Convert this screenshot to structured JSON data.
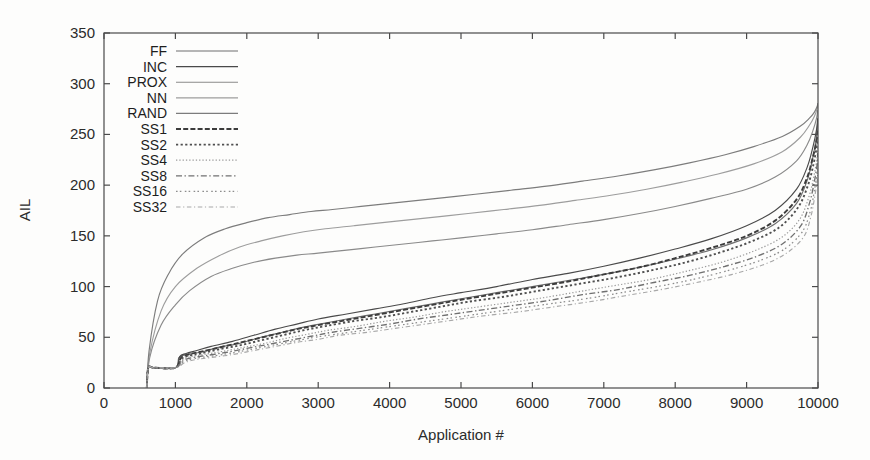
{
  "chart_data": {
    "type": "line",
    "title": "",
    "xlabel": "Application #",
    "ylabel": "AIL",
    "xlim": [
      0,
      10000
    ],
    "ylim": [
      0,
      350
    ],
    "xticks": [
      0,
      1000,
      2000,
      3000,
      4000,
      5000,
      6000,
      7000,
      8000,
      9000,
      10000
    ],
    "yticks": [
      0,
      50,
      100,
      150,
      200,
      250,
      300,
      350
    ],
    "grid": false,
    "legend_position": "top-left-inside",
    "series": [
      {
        "name": "FF",
        "style": "solid",
        "color": "#6f6f6f",
        "x": [
          600,
          620,
          700,
          1000,
          1050,
          1150,
          1250,
          1400,
          1600,
          1900,
          2200,
          2500,
          2800,
          3100,
          3400,
          3800,
          4200,
          4600,
          5000,
          5500,
          6000,
          6500,
          7000,
          7500,
          8000,
          8500,
          9000,
          9400,
          9700,
          9850,
          9930,
          9980,
          9995
        ],
        "y": [
          0,
          20,
          20,
          20,
          30,
          33,
          34,
          36,
          40,
          44,
          50,
          55,
          60,
          64,
          68,
          73,
          78,
          83,
          88,
          94,
          100,
          106,
          112,
          119,
          127,
          136,
          148,
          162,
          182,
          205,
          228,
          248,
          262
        ]
      },
      {
        "name": "INC",
        "style": "solid",
        "color": "#4a4a4a",
        "x": [
          600,
          620,
          700,
          1000,
          1060,
          1150,
          1300,
          1500,
          1800,
          2100,
          2400,
          2700,
          3000,
          3400,
          3800,
          4200,
          4600,
          5000,
          5500,
          6000,
          6500,
          7000,
          7500,
          8000,
          8500,
          9000,
          9400,
          9700,
          9850,
          9930,
          9980,
          9995
        ],
        "y": [
          0,
          20,
          20,
          20,
          31,
          34,
          37,
          41,
          46,
          52,
          58,
          63,
          68,
          73,
          78,
          83,
          89,
          94,
          100,
          107,
          113,
          120,
          128,
          137,
          147,
          160,
          175,
          196,
          218,
          238,
          255,
          266
        ]
      },
      {
        "name": "PROX",
        "style": "solid",
        "color": "#8a8a8a",
        "x": [
          600,
          640,
          800,
          1000,
          1200,
          1500,
          1800,
          2100,
          2400,
          2700,
          3000,
          3400,
          3800,
          4200,
          4600,
          5000,
          5500,
          6000,
          6500,
          7000,
          7500,
          8000,
          8500,
          9000,
          9400,
          9700,
          9850,
          9930,
          9980,
          9995
        ],
        "y": [
          0,
          30,
          62,
          82,
          96,
          110,
          118,
          124,
          128,
          131,
          133,
          136,
          139,
          142,
          145,
          148,
          152,
          156,
          161,
          166,
          172,
          179,
          187,
          196,
          208,
          224,
          240,
          254,
          266,
          274
        ]
      },
      {
        "name": "NN",
        "style": "solid",
        "color": "#9d9d9d",
        "x": [
          600,
          640,
          800,
          1000,
          1300,
          1600,
          1900,
          2200,
          2500,
          2800,
          3100,
          3500,
          3900,
          4300,
          4700,
          5100,
          5600,
          6100,
          6600,
          7100,
          7600,
          8100,
          8600,
          9100,
          9500,
          9750,
          9880,
          9950,
          9990,
          9998
        ],
        "y": [
          0,
          34,
          76,
          100,
          118,
          130,
          139,
          145,
          150,
          154,
          157,
          160,
          163,
          166,
          169,
          172,
          176,
          180,
          185,
          190,
          196,
          203,
          211,
          221,
          233,
          247,
          259,
          268,
          276,
          280
        ]
      },
      {
        "name": "RAND",
        "style": "solid",
        "color": "#7c7c7c",
        "x": [
          600,
          630,
          750,
          900,
          1100,
          1400,
          1700,
          2000,
          2300,
          2600,
          2900,
          3200,
          3600,
          4000,
          4400,
          4800,
          5200,
          5700,
          6200,
          6700,
          7200,
          7700,
          8200,
          8700,
          9100,
          9500,
          9750,
          9880,
          9950,
          9990,
          9998
        ],
        "y": [
          0,
          36,
          86,
          112,
          132,
          148,
          157,
          163,
          168,
          171,
          174,
          176,
          179,
          182,
          185,
          188,
          191,
          195,
          199,
          204,
          209,
          215,
          222,
          230,
          238,
          248,
          258,
          266,
          272,
          278,
          281
        ]
      },
      {
        "name": "SS1",
        "style": "dash",
        "color": "#3c3c3c",
        "x": [
          600,
          620,
          700,
          1000,
          1080,
          1180,
          1300,
          1500,
          1800,
          2100,
          2400,
          2700,
          3000,
          3400,
          3800,
          4200,
          4600,
          5000,
          5500,
          6000,
          6500,
          7000,
          7500,
          8000,
          8500,
          9000,
          9400,
          9700,
          9850,
          9930,
          9980,
          9995
        ],
        "y": [
          0,
          20,
          20,
          20,
          30,
          33,
          35,
          38,
          43,
          48,
          53,
          58,
          62,
          67,
          72,
          77,
          82,
          87,
          93,
          99,
          105,
          112,
          119,
          128,
          138,
          150,
          165,
          186,
          208,
          228,
          244,
          254
        ]
      },
      {
        "name": "SS2",
        "style": "dot-square",
        "color": "#4f4f4f",
        "x": [
          600,
          620,
          700,
          1000,
          1090,
          1200,
          1350,
          1600,
          1900,
          2200,
          2500,
          2800,
          3100,
          3500,
          3900,
          4300,
          4700,
          5100,
          5600,
          6100,
          6600,
          7100,
          7600,
          8100,
          8600,
          9050,
          9450,
          9720,
          9860,
          9935,
          9982,
          9996
        ],
        "y": [
          0,
          20,
          20,
          20,
          29,
          32,
          34,
          38,
          42,
          47,
          52,
          57,
          61,
          66,
          70,
          75,
          80,
          85,
          90,
          96,
          102,
          108,
          115,
          123,
          133,
          144,
          158,
          178,
          200,
          220,
          238,
          249
        ]
      },
      {
        "name": "SS4",
        "style": "dot-fine",
        "color": "#9a9a9a",
        "x": [
          600,
          620,
          700,
          1000,
          1100,
          1220,
          1400,
          1650,
          1950,
          2250,
          2550,
          2850,
          3150,
          3550,
          3950,
          4350,
          4750,
          5150,
          5650,
          6150,
          6650,
          7150,
          7650,
          8150,
          8650,
          9100,
          9480,
          9740,
          9870,
          9940,
          9985,
          9997
        ],
        "y": [
          0,
          20,
          20,
          20,
          28,
          31,
          33,
          36,
          40,
          44,
          49,
          53,
          57,
          61,
          66,
          70,
          75,
          79,
          84,
          89,
          95,
          101,
          107,
          115,
          124,
          135,
          148,
          166,
          188,
          208,
          226,
          238
        ]
      },
      {
        "name": "SS8",
        "style": "dash-dot",
        "color": "#707070",
        "x": [
          600,
          620,
          700,
          1000,
          1110,
          1240,
          1430,
          1700,
          2000,
          2300,
          2600,
          2900,
          3200,
          3600,
          4000,
          4400,
          4800,
          5200,
          5700,
          6200,
          6700,
          7200,
          7700,
          8200,
          8700,
          9150,
          9500,
          9760,
          9880,
          9945,
          9987,
          9998
        ],
        "y": [
          0,
          20,
          20,
          20,
          27,
          30,
          32,
          35,
          39,
          43,
          47,
          51,
          55,
          59,
          63,
          68,
          72,
          76,
          81,
          86,
          92,
          97,
          104,
          111,
          120,
          130,
          142,
          160,
          182,
          202,
          220,
          232
        ]
      },
      {
        "name": "SS16",
        "style": "dash-dot-fine",
        "color": "#8d8d8d",
        "x": [
          600,
          620,
          700,
          1000,
          1120,
          1260,
          1460,
          1750,
          2050,
          2350,
          2650,
          2950,
          3250,
          3650,
          4050,
          4450,
          4850,
          5250,
          5750,
          6250,
          6750,
          7250,
          7750,
          8250,
          8750,
          9200,
          9530,
          9780,
          9895,
          9950,
          9990,
          9999
        ],
        "y": [
          0,
          20,
          20,
          20,
          26,
          29,
          31,
          34,
          38,
          42,
          46,
          50,
          53,
          57,
          61,
          65,
          69,
          73,
          78,
          83,
          88,
          94,
          100,
          107,
          116,
          126,
          137,
          154,
          175,
          195,
          213,
          226
        ]
      },
      {
        "name": "SS32",
        "style": "dash-long-dot",
        "color": "#a8a8a8",
        "x": [
          600,
          620,
          700,
          1000,
          1130,
          1280,
          1490,
          1800,
          2100,
          2400,
          2700,
          3000,
          3300,
          3700,
          4100,
          4500,
          4900,
          5300,
          5800,
          6300,
          6800,
          7300,
          7800,
          8300,
          8800,
          9250,
          9560,
          9800,
          9900,
          9955,
          9992,
          9999
        ],
        "y": [
          0,
          20,
          20,
          20,
          25,
          28,
          30,
          33,
          37,
          41,
          45,
          48,
          52,
          55,
          59,
          63,
          67,
          71,
          75,
          80,
          85,
          91,
          97,
          104,
          112,
          122,
          133,
          149,
          169,
          189,
          207,
          220
        ]
      }
    ]
  },
  "legend": {
    "items": [
      {
        "label": "FF"
      },
      {
        "label": "INC"
      },
      {
        "label": "PROX"
      },
      {
        "label": "NN"
      },
      {
        "label": "RAND"
      },
      {
        "label": "SS1"
      },
      {
        "label": "SS2"
      },
      {
        "label": "SS4"
      },
      {
        "label": "SS8"
      },
      {
        "label": "SS16"
      },
      {
        "label": "SS32"
      }
    ]
  }
}
